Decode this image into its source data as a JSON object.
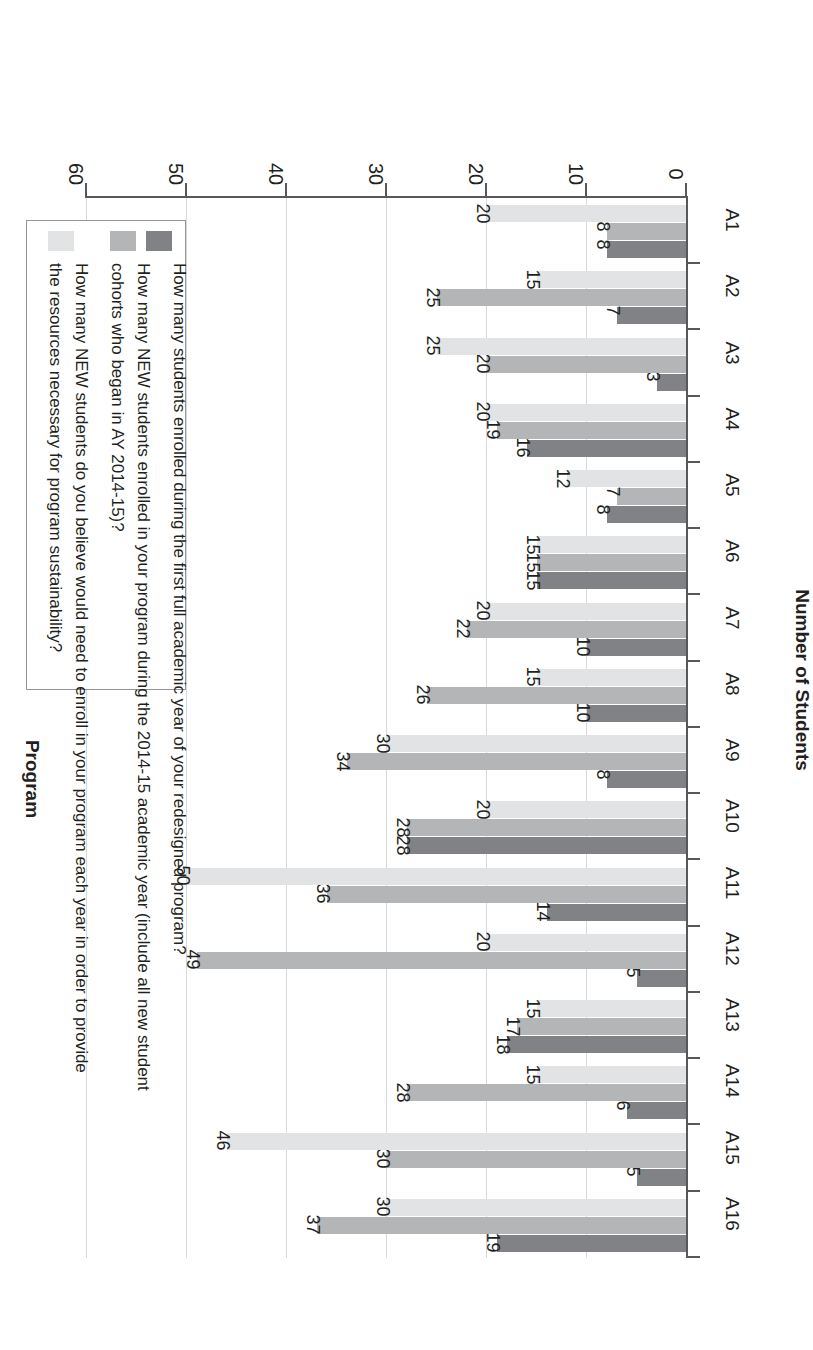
{
  "chart_data": {
    "type": "bar",
    "title": "",
    "orientation": "vertical",
    "xlabel": "Program",
    "ylabel": "Number of Students",
    "ylim": [
      0,
      60
    ],
    "yticks": [
      0,
      10,
      20,
      30,
      40,
      50,
      60
    ],
    "grid": true,
    "legend_position": "right",
    "categories": [
      "A1",
      "A2",
      "A3",
      "A4",
      "A5",
      "A6",
      "A7",
      "A8",
      "A9",
      "A10",
      "A11",
      "A12",
      "A13",
      "A14",
      "A15",
      "A16"
    ],
    "series": [
      {
        "name": "How many students enrolled during the first full academic year of your redesigned program?",
        "color": "#808285",
        "values": [
          8,
          7,
          3,
          16,
          8,
          15,
          10,
          10,
          8,
          28,
          14,
          5,
          18,
          6,
          5,
          19
        ]
      },
      {
        "name": "How many NEW students enrolled in your program during the 2014-15 academic year (include all new student cohorts who began in AY 2014-15)?",
        "color": "#b3b5b7",
        "values": [
          8,
          25,
          20,
          19,
          7,
          15,
          22,
          26,
          34,
          28,
          36,
          49,
          17,
          28,
          30,
          37
        ]
      },
      {
        "name": "How many NEW students do you believe would need to enroll in your program each year in order to provide the resources necessary for program sustainability?",
        "color": "#e2e3e4",
        "values": [
          20,
          15,
          25,
          20,
          12,
          15,
          20,
          15,
          30,
          20,
          50,
          20,
          15,
          15,
          46,
          30
        ]
      }
    ]
  },
  "legend": {
    "entries": [
      {
        "lines": [
          "How many students enrolled during the first full academic year of your redesigned program?"
        ],
        "swatch": "dark-gray-swatch"
      },
      {
        "lines": [
          "How many NEW students enrolled in your program during the 2014-15 academic year (include all new student",
          "cohorts who began in AY 2014-15)?"
        ],
        "swatch": "medium-gray-swatch"
      },
      {
        "lines": [
          "How many NEW students do you believe would need to enroll in your program each year in order to provide",
          "the resources necessary for program sustainability?"
        ],
        "swatch": "light-gray-swatch"
      }
    ]
  },
  "axes": {
    "y_title": "Number of Students",
    "x_title": "Program",
    "y_tick_labels": [
      "0",
      "10",
      "20",
      "30",
      "40",
      "50",
      "60"
    ]
  },
  "colors": {
    "series_dark": "#808285",
    "series_medium": "#b3b5b7",
    "series_light": "#e2e3e4",
    "axis": "#58585a",
    "grid": "#d9d9d9",
    "text": "#231f20"
  }
}
